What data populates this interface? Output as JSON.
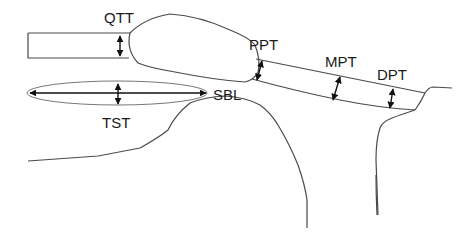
{
  "diagram": {
    "type": "anatomical-schematic",
    "colors": {
      "line": "#4a4a4a",
      "arrow": "#111111",
      "text": "#1a1a1a",
      "background": "#ffffff"
    },
    "labels": {
      "qtt": "QTT",
      "ppt": "PPT",
      "mpt": "MPT",
      "dpt": "DPT",
      "sbl": "SBL",
      "tst": "TST"
    },
    "measurements": [
      {
        "id": "qtt",
        "label": "QTT",
        "kind": "thickness"
      },
      {
        "id": "ppt",
        "label": "PPT",
        "kind": "thickness"
      },
      {
        "id": "mpt",
        "label": "MPT",
        "kind": "thickness"
      },
      {
        "id": "dpt",
        "label": "DPT",
        "kind": "thickness"
      },
      {
        "id": "tst",
        "label": "TST",
        "kind": "thickness"
      },
      {
        "id": "sbl",
        "label": "SBL",
        "kind": "length"
      }
    ]
  }
}
